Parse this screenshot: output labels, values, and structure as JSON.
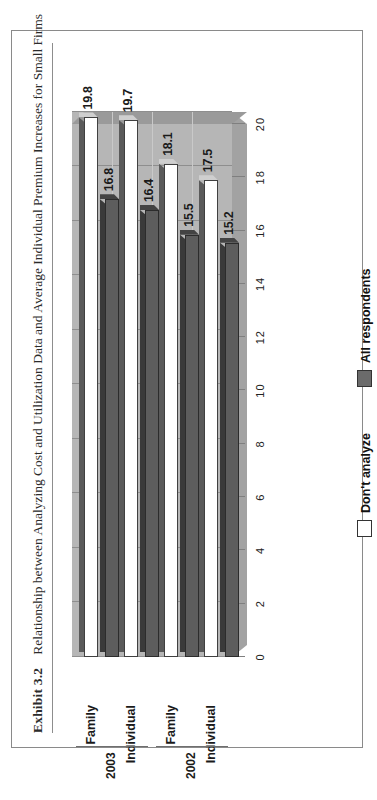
{
  "exhibit": {
    "number": "Exhibit 3.2",
    "title": "Relationship between Analyzing Cost and Utilization Data and Average Individual Premium Increases for Small Firms"
  },
  "note": "Note: Analyzing cost and utilization data is associated with lower premium increases for small firms (up to 249 workers)",
  "legend": {
    "items": [
      {
        "label": "Don't analyze",
        "color": "#ffffff"
      },
      {
        "label": "All respondents",
        "color": "#6b6b6b"
      }
    ]
  },
  "axis": {
    "ticks": [
      "20",
      "18",
      "16",
      "14",
      "12",
      "10",
      "8",
      "6",
      "4",
      "2",
      "0"
    ],
    "max": 20,
    "min": 0
  },
  "groups": [
    {
      "year": "2002",
      "categories": [
        "Individual",
        "Family"
      ]
    },
    {
      "year": "2003",
      "categories": [
        "Individual",
        "Family"
      ]
    }
  ],
  "chart_data": {
    "type": "bar",
    "orientation": "horizontal",
    "title": "Relationship between Analyzing Cost and Utilization Data and Average Individual Premium Increases for Small Firms",
    "xlabel": "",
    "ylabel": "",
    "ylim": [
      0,
      20
    ],
    "grid": true,
    "legend_position": "bottom",
    "categories": [
      "2002 Individual",
      "2002 Family",
      "2003 Individual",
      "2003 Family"
    ],
    "series": [
      {
        "name": "Don't analyze",
        "color": "#ffffff",
        "values": [
          17.5,
          18.1,
          19.7,
          19.8
        ]
      },
      {
        "name": "All respondents",
        "color": "#6b6b6b",
        "values": [
          15.2,
          15.5,
          16.4,
          16.8
        ]
      }
    ],
    "data_labels": [
      "17.5",
      "15.2",
      "18.1",
      "15.5",
      "19.7",
      "16.4",
      "19.8",
      "16.8"
    ],
    "note": "Note: Analyzing cost and utilization data is associated with lower premium increases for small firms (up to 249 workers)"
  }
}
